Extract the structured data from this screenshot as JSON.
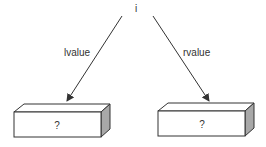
{
  "diagram": {
    "root": {
      "label": "i"
    },
    "edges": [
      {
        "label": "lvalue",
        "from": "root",
        "to": "left_box"
      },
      {
        "label": "rvalue",
        "from": "root",
        "to": "right_box"
      }
    ],
    "boxes": {
      "left_box": {
        "label": "?"
      },
      "right_box": {
        "label": "?"
      }
    },
    "colors": {
      "stroke": "#333333",
      "side_face": "#a8a8a8",
      "background": "#ffffff"
    }
  }
}
